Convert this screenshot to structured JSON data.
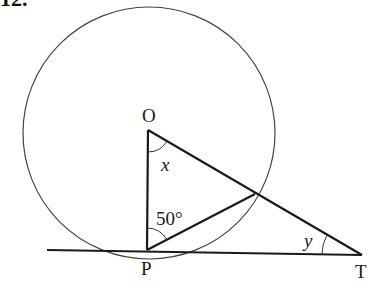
{
  "question_number": "12.",
  "diagram": {
    "points": {
      "O": {
        "label": "O",
        "x": 148,
        "y": 130
      },
      "P": {
        "label": "P",
        "x": 147,
        "y": 250
      },
      "T": {
        "label": "T",
        "x": 362,
        "y": 255
      },
      "Q": {
        "label": "",
        "x": 255,
        "y": 194
      }
    },
    "circle": {
      "cx": 149,
      "cy": 133,
      "r": 126
    },
    "angles": {
      "at_O": {
        "label": "x"
      },
      "at_P": {
        "label": "50°"
      },
      "at_T": {
        "label": "y"
      }
    },
    "colors": {
      "stroke": "#1a1a1a",
      "circle": "#444444"
    }
  }
}
